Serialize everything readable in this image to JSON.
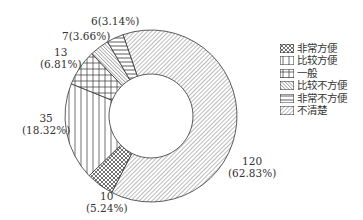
{
  "chart_data": {
    "type": "pie",
    "variant": "donut",
    "title": "",
    "categories": [
      "非常方便",
      "比较方便",
      "一般",
      "比较不方便",
      "非常不方便",
      "不清楚"
    ],
    "values": [
      10,
      35,
      13,
      7,
      6,
      120
    ],
    "percentages": [
      5.24,
      18.32,
      6.81,
      3.66,
      3.14,
      62.83
    ],
    "labels": [
      "10\n(5.24%)",
      "35\n(18.32%)",
      "13\n(6.81%)",
      "7(3.66%)",
      "6(3.14%)",
      "120\n(62.83%)"
    ],
    "legend_position": "right",
    "patterns": [
      "dots-cross",
      "vertical-lines",
      "grid",
      "dense-diagonal",
      "horizontal-lines",
      "diagonal"
    ]
  },
  "labels": {
    "l0a": "10",
    "l0b": "(5.24%)",
    "l1a": "35",
    "l1b": "(18.32%)",
    "l2a": "13",
    "l2b": "(6.81%)",
    "l3": "7(3.66%)",
    "l4": "6(3.14%)",
    "l5a": "120",
    "l5b": "(62.83%)"
  },
  "legend": [
    "非常方便",
    "比较方便",
    "一般",
    "比较不方便",
    "非常不方便",
    "不清楚"
  ]
}
